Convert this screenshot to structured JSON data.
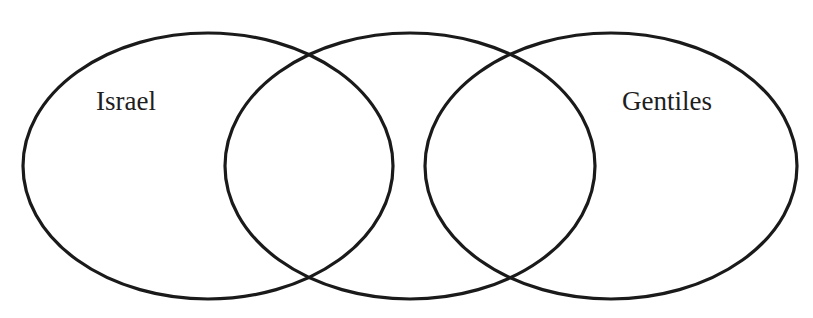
{
  "diagram": {
    "title": "The Chosen",
    "stroke_color": "#1a1a1a",
    "background": "#ffffff",
    "sets": [
      {
        "id": "israel",
        "label": "Israel",
        "cx": 208,
        "cy": 166,
        "rx": 185,
        "ry": 133
      },
      {
        "id": "middle",
        "label": "",
        "cx": 410,
        "cy": 166,
        "rx": 185,
        "ry": 133
      },
      {
        "id": "gentiles",
        "label": "Gentiles",
        "cx": 611,
        "cy": 166,
        "rx": 186,
        "ry": 133
      }
    ]
  }
}
